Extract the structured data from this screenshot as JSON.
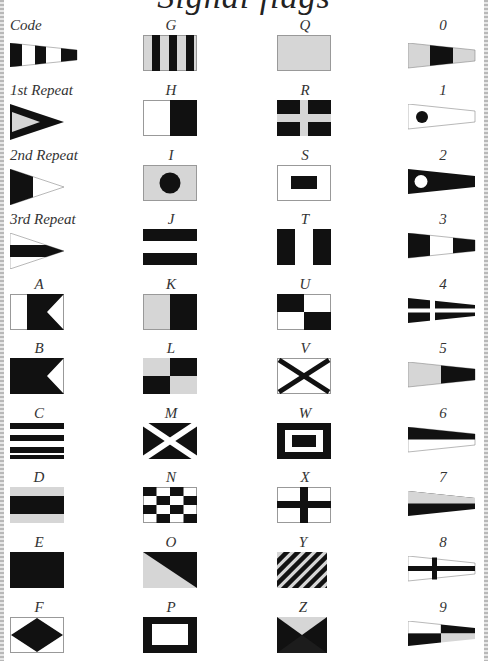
{
  "title": "Signal flags",
  "colors": {
    "dark": "#111111",
    "light": "#d6d6d6",
    "white": "#ffffff",
    "outline": "#9a9a9a"
  },
  "columns": [
    {
      "items": [
        {
          "label": "Code",
          "flag": "code-pennant"
        },
        {
          "label": "1st Repeat",
          "flag": "first-repeat"
        },
        {
          "label": "2nd Repeat",
          "flag": "second-repeat"
        },
        {
          "label": "3rd Repeat",
          "flag": "third-repeat"
        },
        {
          "label": "A",
          "flag": "flag-a"
        },
        {
          "label": "B",
          "flag": "flag-b"
        },
        {
          "label": "C",
          "flag": "flag-c"
        },
        {
          "label": "D",
          "flag": "flag-d"
        },
        {
          "label": "E",
          "flag": "flag-e"
        },
        {
          "label": "F",
          "flag": "flag-f"
        }
      ]
    },
    {
      "items": [
        {
          "label": "G",
          "flag": "flag-g"
        },
        {
          "label": "H",
          "flag": "flag-h"
        },
        {
          "label": "I",
          "flag": "flag-i"
        },
        {
          "label": "J",
          "flag": "flag-j"
        },
        {
          "label": "K",
          "flag": "flag-k"
        },
        {
          "label": "L",
          "flag": "flag-l"
        },
        {
          "label": "M",
          "flag": "flag-m"
        },
        {
          "label": "N",
          "flag": "flag-n"
        },
        {
          "label": "O",
          "flag": "flag-o"
        },
        {
          "label": "P",
          "flag": "flag-p"
        }
      ]
    },
    {
      "items": [
        {
          "label": "Q",
          "flag": "flag-q"
        },
        {
          "label": "R",
          "flag": "flag-r"
        },
        {
          "label": "S",
          "flag": "flag-s"
        },
        {
          "label": "T",
          "flag": "flag-t"
        },
        {
          "label": "U",
          "flag": "flag-u"
        },
        {
          "label": "V",
          "flag": "flag-v"
        },
        {
          "label": "W",
          "flag": "flag-w"
        },
        {
          "label": "X",
          "flag": "flag-x"
        },
        {
          "label": "Y",
          "flag": "flag-y"
        },
        {
          "label": "Z",
          "flag": "flag-z"
        }
      ]
    },
    {
      "items": [
        {
          "label": "0",
          "flag": "pennant-0"
        },
        {
          "label": "1",
          "flag": "pennant-1"
        },
        {
          "label": "2",
          "flag": "pennant-2"
        },
        {
          "label": "3",
          "flag": "pennant-3"
        },
        {
          "label": "4",
          "flag": "pennant-4"
        },
        {
          "label": "5",
          "flag": "pennant-5"
        },
        {
          "label": "6",
          "flag": "pennant-6"
        },
        {
          "label": "7",
          "flag": "pennant-7"
        },
        {
          "label": "8",
          "flag": "pennant-8"
        },
        {
          "label": "9",
          "flag": "pennant-9"
        }
      ]
    }
  ]
}
